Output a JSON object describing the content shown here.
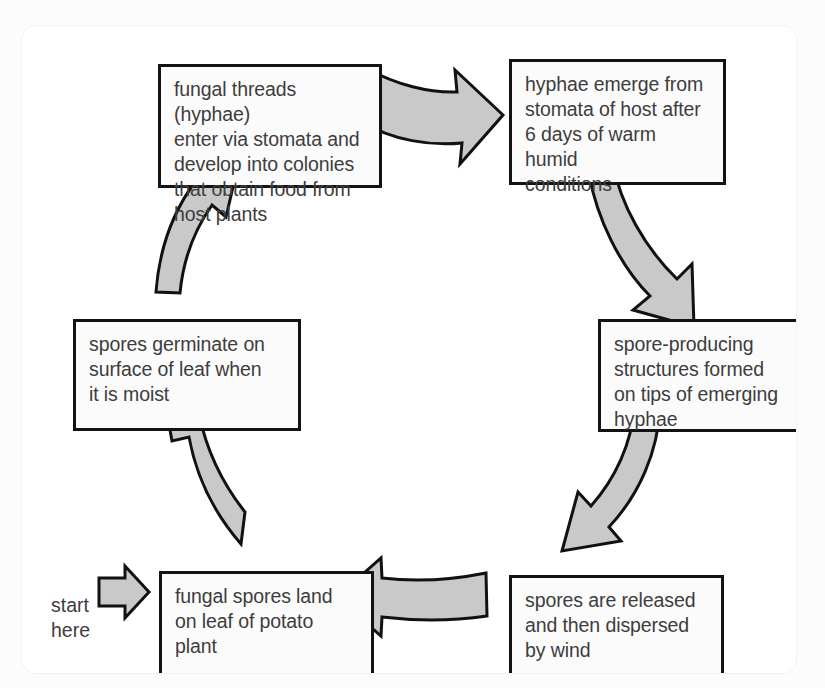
{
  "diagram": {
    "type": "cycle-flow-diagram",
    "title": "",
    "start_label": "start\nhere",
    "arrow_color": "#c9c9c9",
    "arrow_outline_color": "#111111",
    "box_border_color": "#131313",
    "box_fill_color": "#fbfbfb",
    "text_color": "#3d3d3d",
    "stages": [
      {
        "id": "spores-land",
        "order": 1,
        "text": "fungal spores land\non leaf of potato\nplant",
        "position": "bottom-left"
      },
      {
        "id": "spores-germinate",
        "order": 2,
        "text": "spores germinate on\nsurface of leaf when\nit is moist",
        "position": "middle-left"
      },
      {
        "id": "hyphae-enter",
        "order": 3,
        "text": "fungal threads (hyphae)\nenter via stomata and\ndevelop into colonies\nthat obtain food from\nhost plants",
        "position": "top-left"
      },
      {
        "id": "hyphae-emerge",
        "order": 4,
        "text": "hyphae emerge from\nstomata of host after\n6 days of warm humid\nconditions",
        "position": "top-right"
      },
      {
        "id": "spore-structures",
        "order": 5,
        "text": "spore-producing\nstructures formed\non tips of emerging\nhyphae",
        "position": "middle-right"
      },
      {
        "id": "spores-released",
        "order": 6,
        "text": "spores are released\nand then dispersed\nby wind",
        "position": "bottom-right"
      }
    ],
    "arrows": [
      {
        "id": "start-entry",
        "from": "start",
        "to": "spores-land",
        "direction": "right"
      },
      {
        "id": "land-to-germinate",
        "from": "spores-land",
        "to": "spores-germinate",
        "direction": "up-left"
      },
      {
        "id": "germinate-to-enter",
        "from": "spores-germinate",
        "to": "hyphae-enter",
        "direction": "up-right"
      },
      {
        "id": "enter-to-emerge",
        "from": "hyphae-enter",
        "to": "hyphae-emerge",
        "direction": "right"
      },
      {
        "id": "emerge-to-structures",
        "from": "hyphae-emerge",
        "to": "spore-structures",
        "direction": "down-right"
      },
      {
        "id": "structures-to-released",
        "from": "spore-structures",
        "to": "spores-released",
        "direction": "down-left"
      },
      {
        "id": "released-to-land",
        "from": "spores-released",
        "to": "spores-land",
        "direction": "left"
      }
    ]
  }
}
